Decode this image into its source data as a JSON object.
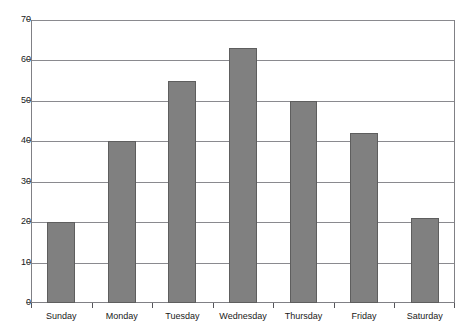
{
  "chart_data": {
    "type": "bar",
    "title": "",
    "xlabel": "",
    "ylabel": "",
    "categories": [
      "Sunday",
      "Monday",
      "Tuesday",
      "Wednesday",
      "Thursday",
      "Friday",
      "Saturday"
    ],
    "values": [
      20,
      40,
      55,
      63,
      50,
      42,
      21
    ],
    "ylim": [
      0,
      70
    ],
    "ytick_labels": [
      "70",
      "60",
      "50",
      "40",
      "30",
      "20",
      "10",
      "0"
    ],
    "ytick_values": [
      70,
      60,
      50,
      40,
      30,
      20,
      10,
      0
    ],
    "ytick_step": 10,
    "grid": "horizontal",
    "legend": "none",
    "bar_color": "#808080",
    "bar_edge_color": "#5e5e5e",
    "gridline_color": "#8a8a8f",
    "axis_color": "#808085",
    "background_color": "#ffffff"
  },
  "figure": {
    "clipped_title_fragment": ""
  }
}
